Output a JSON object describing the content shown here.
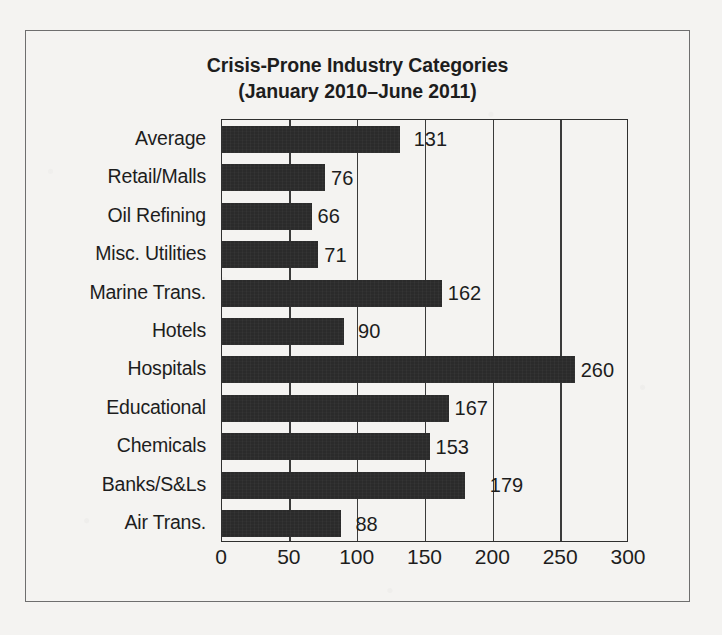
{
  "figure": {
    "title_line1": "Crisis-Prone Industry Categories",
    "title_line2": "(January 2010–June 2011)",
    "bar_color": "#2b2b2b",
    "frame_color": "#2f2f2f",
    "background_color": "#f4f3f1",
    "text_color": "#1d1d1d"
  },
  "chart_data": {
    "type": "bar",
    "orientation": "horizontal",
    "title": "Crisis-Prone Industry Categories (January 2010–June 2011)",
    "xlabel": "",
    "ylabel": "",
    "xlim": [
      0,
      300
    ],
    "xticks": [
      0,
      50,
      100,
      150,
      200,
      250,
      300
    ],
    "xtick_labels": [
      "0",
      "50",
      "100",
      "150",
      "200",
      "250",
      "300"
    ],
    "grid": true,
    "legend": false,
    "categories": [
      "Average",
      "Retail/Malls",
      "Oil Refining",
      "Misc. Utilities",
      "Marine Trans.",
      "Hotels",
      "Hospitals",
      "Educational",
      "Chemicals",
      "Banks/S&Ls",
      "Air Trans."
    ],
    "values": [
      131,
      76,
      66,
      71,
      162,
      90,
      260,
      167,
      153,
      179,
      88
    ],
    "data_labels": [
      "131",
      "76",
      "66",
      "71",
      "162",
      "90",
      "260",
      "167",
      "153",
      "179",
      "88"
    ],
    "label_offsets": [
      14,
      6,
      6,
      6,
      6,
      14,
      6,
      6,
      6,
      25,
      14
    ]
  }
}
